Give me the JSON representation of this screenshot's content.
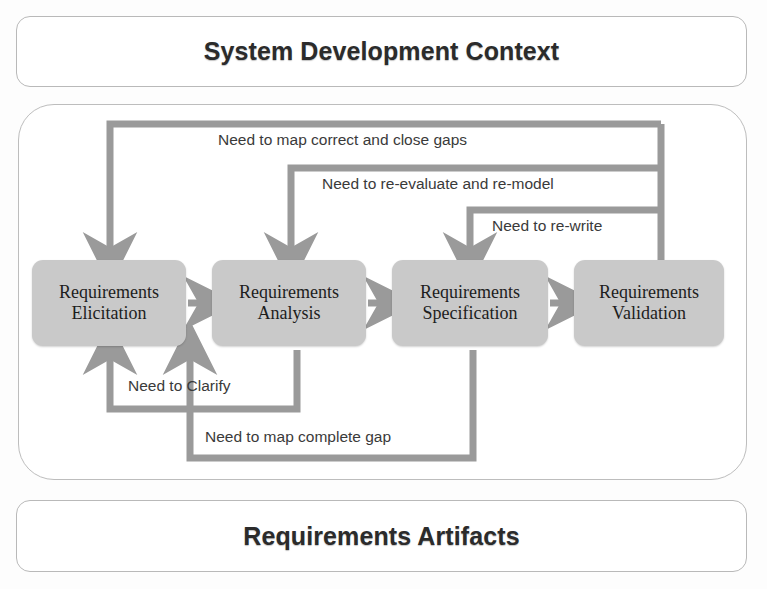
{
  "header": {
    "title": "System Development Context"
  },
  "footer": {
    "title": "Requirements Artifacts"
  },
  "process": {
    "boxes": [
      {
        "id": "elicitation",
        "line1": "Requirements",
        "line2": "Elicitation"
      },
      {
        "id": "analysis",
        "line1": "Requirements",
        "line2": "Analysis"
      },
      {
        "id": "specification",
        "line1": "Requirements",
        "line2": "Specification"
      },
      {
        "id": "validation",
        "line1": "Requirements",
        "line2": "Validation"
      }
    ]
  },
  "flow_labels": {
    "forward": [
      "",
      "",
      ""
    ],
    "map_correct": "Need to map correct and close gaps",
    "reevaluate": "Need to re-evaluate and re-model",
    "rewrite": "Need to re-write",
    "clarify": "Need to Clarify",
    "map_complete": "Need to map complete gap"
  },
  "colors": {
    "box_fill": "#c9c9c9",
    "connector": "#9a9a9a",
    "panel_border": "#bdbdbd",
    "text": "#1d1d1d",
    "caption_text": "#3a3a3a",
    "background": "#fdfdfd"
  },
  "diagram": {
    "type": "process-flow",
    "forward_sequence": [
      "Requirements Elicitation",
      "Requirements Analysis",
      "Requirements Specification",
      "Requirements Validation"
    ],
    "feedback_edges": [
      {
        "from": "Requirements Validation",
        "to": "Requirements Elicitation",
        "label": "Need to map correct and close gaps"
      },
      {
        "from": "Requirements Validation",
        "to": "Requirements Analysis",
        "label": "Need to re-evaluate and re-model"
      },
      {
        "from": "Requirements Validation",
        "to": "Requirements Specification",
        "label": "Need to re-write"
      },
      {
        "from": "Requirements Analysis",
        "to": "Requirements Elicitation",
        "label": "Need to Clarify"
      },
      {
        "from": "Requirements Specification",
        "to": "Requirements Analysis",
        "label": "Need to map complete gap"
      }
    ]
  }
}
